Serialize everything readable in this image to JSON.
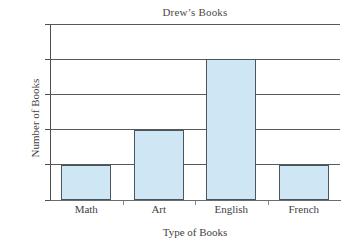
{
  "chart_data": {
    "type": "bar",
    "title": "Drew’s Books",
    "xlabel": "Type of Books",
    "ylabel": "Number of Books",
    "categories": [
      "Math",
      "Art",
      "English",
      "French"
    ],
    "values": [
      2,
      4,
      8,
      2
    ],
    "ylim": [
      0,
      10
    ],
    "ytick_values": [
      0,
      2,
      4,
      6,
      8,
      10
    ],
    "ytick_labels": [
      "0",
      "2",
      "4",
      "6",
      "8",
      "10"
    ],
    "grid": "horizontal",
    "legend": "none",
    "bar_fill_color": "#cfe7f5",
    "bar_border_color": "#4a5560",
    "gridline_color": "#585858",
    "axis_color": "#4d4d4d",
    "background_color": "#ffffff"
  }
}
